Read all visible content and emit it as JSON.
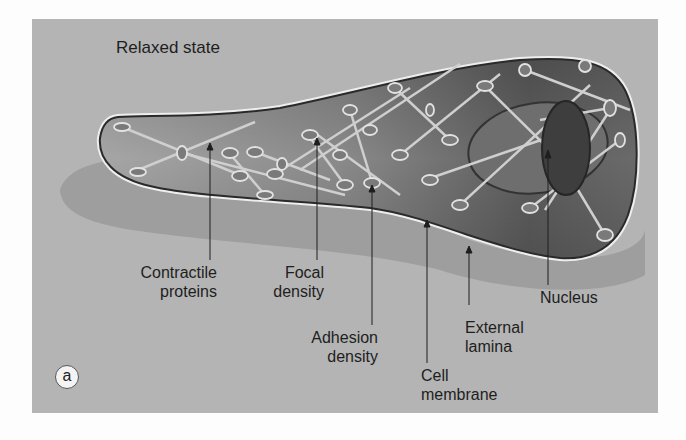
{
  "figure": {
    "title": "Relaxed state",
    "panel_label": "a",
    "colors": {
      "background": "#b4b4b4",
      "shadow": "#9c9c9c",
      "cytoplasm_dark": "#5a5a5a",
      "cytoplasm_light": "#a8a8a8",
      "membrane": "#2a2a2a",
      "external_lamina": "#eeeeee",
      "nucleus_shadow": "#6e6e6e",
      "nucleus": "#3c3c3c",
      "filament": "#c8c8c8"
    }
  },
  "labels": {
    "contractile_proteins": {
      "line1": "Contractile",
      "line2": "proteins"
    },
    "focal_density": {
      "line1": "Focal",
      "line2": "density"
    },
    "adhesion_density": {
      "line1": "Adhesion",
      "line2": "density"
    },
    "cell_membrane": {
      "line1": "Cell",
      "line2": "membrane"
    },
    "external_lamina": {
      "line1": "External",
      "line2": "lamina"
    },
    "nucleus": {
      "line1": "Nucleus"
    }
  }
}
